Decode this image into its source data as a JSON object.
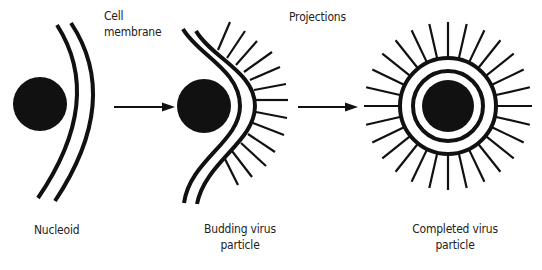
{
  "labels": {
    "cell_membrane_line1": "Cell",
    "cell_membrane_line2": "membrane",
    "projections": "Projections",
    "nucleoid": "Nucleoid",
    "budding_line1": "Budding virus",
    "budding_line2": "particle",
    "completed_line1": "Completed virus",
    "completed_line2": "particle"
  },
  "stages": [
    {
      "name": "Nucleoid",
      "order": 1
    },
    {
      "name": "Budding virus particle",
      "order": 2
    },
    {
      "name": "Completed virus particle",
      "order": 3
    }
  ],
  "colors": {
    "ink": "#111111",
    "background": "#ffffff"
  }
}
